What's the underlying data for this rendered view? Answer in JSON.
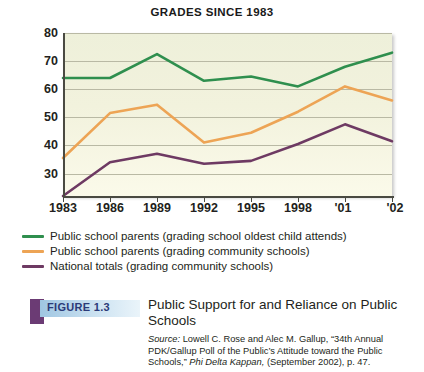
{
  "chart_data": {
    "type": "line",
    "title": "GRADES SINCE 1983",
    "xlabel": "",
    "ylabel": "Percent A and B",
    "ylim": [
      22,
      80
    ],
    "yticks": [
      80,
      70,
      60,
      50,
      40,
      30
    ],
    "grid": true,
    "legend_position": "below",
    "categories": [
      "1983",
      "1986",
      "1989",
      "1992",
      "1995",
      "1998",
      "'01",
      "'02"
    ],
    "xtick_labels": [
      "1983",
      "1986",
      "1989",
      "1992",
      "1995",
      "1998",
      "'01",
      "'02"
    ],
    "series": [
      {
        "name": "Public school parents (grading school oldest child attends)",
        "color": "#2f8f4e",
        "values": [
          64,
          64,
          72.5,
          63,
          64.5,
          61,
          68,
          73
        ]
      },
      {
        "name": "Public school parents (grading community schools)",
        "color": "#eda455",
        "values": [
          35.5,
          51.5,
          54.5,
          41,
          44.5,
          52,
          61,
          56
        ]
      },
      {
        "name": "National totals (grading community schools)",
        "color": "#6e3a63",
        "values": [
          22,
          34,
          37,
          33.5,
          34.5,
          40.5,
          47.5,
          41.5
        ]
      }
    ]
  },
  "legend": {
    "items": [
      {
        "label": "Public school parents (grading school oldest child attends)",
        "color": "#2f8f4e"
      },
      {
        "label": "Public school parents (grading community schools)",
        "color": "#eda455"
      },
      {
        "label": "National totals (grading community schools)",
        "color": "#6e3a63"
      }
    ]
  },
  "caption": {
    "figure_number": "FIGURE 1.3",
    "title": "Public Support for and Reliance on Public Schools",
    "source_prefix": "Source:",
    "source_part1": " Lowell C. Rose and Alec M. Gallup, “34th Annual PDK/Gallup Poll of the Public’s Attitude toward the Public Schools,” ",
    "source_journal": "Phi Delta Kappan,",
    "source_part2": " (September 2002), p. 47."
  },
  "colors": {
    "plot_background": "#f2f2dd",
    "grid": "#b9b9a4",
    "axis": "#4a4a42",
    "figure_square": "#6b3b74",
    "figure_band": "#9fc6e2",
    "figure_number_text": "#2b3a78"
  }
}
